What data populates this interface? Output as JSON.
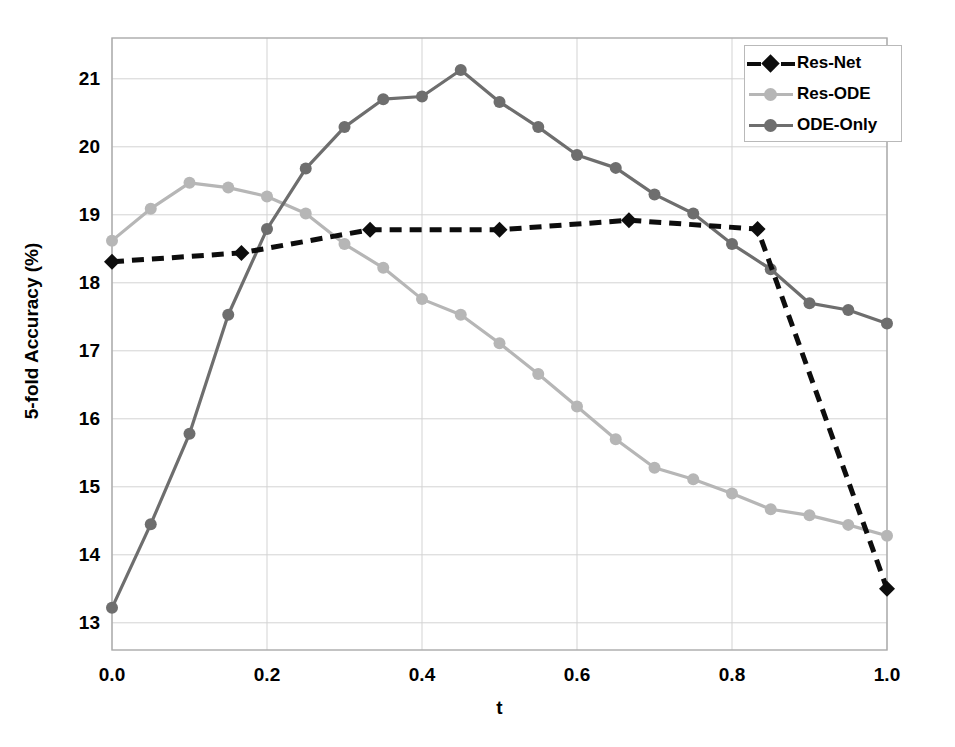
{
  "chart_data": {
    "type": "line",
    "title": "",
    "xlabel": "t",
    "ylabel": "5-fold Accuracy (%)",
    "xlim": [
      0.0,
      1.0
    ],
    "ylim": [
      12.6,
      21.6
    ],
    "grid": true,
    "legend_position": "top-right",
    "xticks": [
      "0.0",
      "0.2",
      "0.4",
      "0.6",
      "0.8",
      "1.0"
    ],
    "xtick_values": [
      0.0,
      0.2,
      0.4,
      0.6,
      0.8,
      1.0
    ],
    "yticks": [
      "13",
      "14",
      "15",
      "16",
      "17",
      "18",
      "19",
      "20",
      "21"
    ],
    "ytick_values": [
      13,
      14,
      15,
      16,
      17,
      18,
      19,
      20,
      21
    ],
    "series": [
      {
        "name": "Res-Net",
        "color": "#0d0d0d",
        "line_style": "dashed",
        "marker": "diamond",
        "x": [
          0.0,
          0.167,
          0.333,
          0.5,
          0.667,
          0.833,
          1.0
        ],
        "values": [
          18.31,
          18.44,
          18.78,
          18.78,
          18.92,
          18.79,
          13.5
        ]
      },
      {
        "name": "Res-ODE",
        "color": "#b6b6b6",
        "line_style": "solid",
        "marker": "circle",
        "x": [
          0.0,
          0.05,
          0.1,
          0.15,
          0.2,
          0.25,
          0.3,
          0.35,
          0.4,
          0.45,
          0.5,
          0.55,
          0.6,
          0.65,
          0.7,
          0.75,
          0.8,
          0.85,
          0.9,
          0.95,
          1.0
        ],
        "values": [
          18.62,
          19.09,
          19.47,
          19.4,
          19.27,
          19.02,
          18.57,
          18.22,
          17.76,
          17.53,
          17.11,
          16.66,
          16.18,
          15.7,
          15.28,
          15.11,
          14.9,
          14.67,
          14.58,
          14.44,
          14.28
        ]
      },
      {
        "name": "ODE-Only",
        "color": "#6e6e6e",
        "line_style": "solid",
        "marker": "circle",
        "x": [
          0.0,
          0.05,
          0.1,
          0.15,
          0.2,
          0.25,
          0.3,
          0.35,
          0.4,
          0.45,
          0.5,
          0.55,
          0.6,
          0.65,
          0.7,
          0.75,
          0.8,
          0.85,
          0.9,
          0.95,
          1.0
        ],
        "values": [
          13.22,
          14.45,
          15.78,
          17.53,
          18.79,
          19.68,
          20.29,
          20.7,
          20.74,
          21.13,
          20.66,
          20.29,
          19.88,
          19.69,
          19.3,
          19.02,
          18.57,
          18.2,
          17.7,
          17.6,
          17.4
        ]
      }
    ]
  },
  "legend": {
    "entries": [
      {
        "label": "Res-Net"
      },
      {
        "label": "Res-ODE"
      },
      {
        "label": "ODE-Only"
      }
    ]
  },
  "axes": {
    "y_title": "5-fold Accuracy (%)",
    "x_title": "t"
  },
  "colors": {
    "res_net": "#0d0d0d",
    "res_ode": "#b6b6b6",
    "ode_only": "#6e6e6e",
    "grid": "#d3d3d3",
    "frame": "#aaaaaa"
  }
}
